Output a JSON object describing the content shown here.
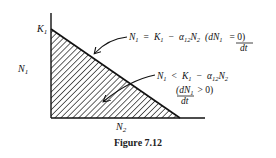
{
  "figure": {
    "caption": "Figure 7.12",
    "axes": {
      "y_label": "N",
      "y_label_sub": "1",
      "x_label": "N",
      "x_label_sub": "2",
      "intercept_label": "K",
      "intercept_label_sub": "1"
    },
    "annotations": [
      {
        "id": "isocline",
        "line1": "N₁ = K₁ − α₁₂N₂  (dN₁ = 0)",
        "line2": "dt",
        "parts": {
          "lhs": "N",
          "lhs_sub": "1",
          "eq": "=",
          "k": "K",
          "k_sub": "1",
          "minus": "−",
          "alpha": "α",
          "alpha_sub": "12",
          "n2": "N",
          "n2_sub": "2",
          "deriv_num": "(dN",
          "deriv_num_sub": "1",
          "deriv_rel": "= 0)",
          "deriv_den": "dt"
        }
      },
      {
        "id": "growth-region",
        "parts": {
          "lhs": "N",
          "lhs_sub": "1",
          "rel": "<",
          "k": "K",
          "k_sub": "1",
          "minus": "−",
          "alpha": "α",
          "alpha_sub": "12",
          "n2": "N",
          "n2_sub": "2",
          "deriv_num": "(dN",
          "deriv_num_sub": "1",
          "deriv_rel": "> 0)",
          "deriv_den": "dt"
        }
      }
    ],
    "colors": {
      "ink": "#111111",
      "background": "#ffffff"
    }
  }
}
